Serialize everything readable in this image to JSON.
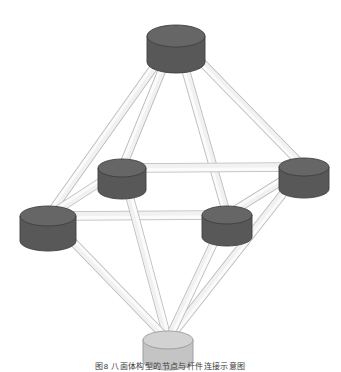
{
  "figure": {
    "caption": "图8  八面体构型的节点与杆件连接示意图",
    "background_color": "#ffffff",
    "node_dark_top_color": "#666666",
    "node_dark_body_color": "#585858",
    "node_dark_edge_color": "#3f3f3f",
    "node_light_top_color": "#d2d2d2",
    "node_light_body_color": "#c4c4c4",
    "node_light_edge_color": "#9a9a9a",
    "rod_fill_color": "#f1f1f1",
    "rod_highlight_color": "#fbfbfb",
    "rod_edge_color": "#b9b9b9",
    "node_count": 6,
    "rod_count": 12,
    "nodes": [
      {
        "id": "apex-top",
        "label": "Top apex node",
        "cx": 176,
        "cy": 36,
        "rx": 29,
        "ry": 11,
        "h": 26,
        "tone": "dark"
      },
      {
        "id": "equator-upleft",
        "label": "Upper-left ring node",
        "cx": 122,
        "cy": 168,
        "rx": 24,
        "ry": 9,
        "h": 22,
        "tone": "dark"
      },
      {
        "id": "equator-upright",
        "label": "Upper-right ring node",
        "cx": 304,
        "cy": 167,
        "rx": 25,
        "ry": 9,
        "h": 22,
        "tone": "dark"
      },
      {
        "id": "equator-lowleft",
        "label": "Lower-left ring node",
        "cx": 48,
        "cy": 216,
        "rx": 28,
        "ry": 10,
        "h": 25,
        "tone": "dark"
      },
      {
        "id": "equator-lowright",
        "label": "Center-right ring node",
        "cx": 227,
        "cy": 215,
        "rx": 25,
        "ry": 9,
        "h": 22,
        "tone": "dark"
      },
      {
        "id": "apex-bottom",
        "label": "Bottom apex node",
        "cx": 168,
        "cy": 340,
        "rx": 25,
        "ry": 9,
        "h": 21,
        "tone": "light"
      }
    ],
    "rods": [
      {
        "from": "apex-top",
        "to": "equator-upleft",
        "w": 7
      },
      {
        "from": "apex-top",
        "to": "equator-upright",
        "w": 7
      },
      {
        "from": "apex-top",
        "to": "equator-lowleft",
        "w": 7
      },
      {
        "from": "apex-top",
        "to": "equator-lowright",
        "w": 7
      },
      {
        "from": "equator-upleft",
        "to": "equator-upright",
        "w": 8
      },
      {
        "from": "equator-lowleft",
        "to": "equator-lowright",
        "w": 8
      },
      {
        "from": "equator-upleft",
        "to": "equator-lowleft",
        "w": 7
      },
      {
        "from": "equator-upright",
        "to": "equator-lowright",
        "w": 7
      },
      {
        "from": "apex-bottom",
        "to": "equator-upleft",
        "w": 7
      },
      {
        "from": "apex-bottom",
        "to": "equator-upright",
        "w": 7
      },
      {
        "from": "apex-bottom",
        "to": "equator-lowleft",
        "w": 7
      },
      {
        "from": "apex-bottom",
        "to": "equator-lowright",
        "w": 7
      }
    ]
  }
}
